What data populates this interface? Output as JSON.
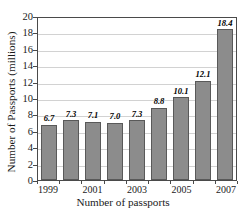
{
  "chart_data": {
    "type": "bar",
    "title": "",
    "xlabel": "Number of passports",
    "ylabel": "Number of Passports (millions)",
    "categories": [
      "1999",
      "2000",
      "2001",
      "2002",
      "2003",
      "2004",
      "2005",
      "2006",
      "2007"
    ],
    "values": [
      6.7,
      7.3,
      7.1,
      7.0,
      7.3,
      8.8,
      10.1,
      12.1,
      18.4
    ],
    "value_labels": [
      "6.7",
      "7.3",
      "7.1",
      "7.0",
      "7.3",
      "8.8",
      "10.1",
      "12.1",
      "18.4"
    ],
    "visible_category_labels": [
      "1999",
      "2001",
      "2003",
      "2005",
      "2007"
    ],
    "ylim": [
      0,
      20
    ],
    "ytick_values": [
      0,
      2,
      4,
      6,
      8,
      10,
      12,
      14,
      16,
      18,
      20
    ],
    "ytick_labels": [
      "0",
      "2",
      "4",
      "6",
      "8",
      "10",
      "12",
      "14",
      "16",
      "18",
      "20"
    ],
    "grid": true,
    "legend": "none",
    "bar_color": "#8c8c8c",
    "bar_edge_color": "#595959",
    "grid_color": "#d2d2d2",
    "axis_color": "#4a4a4a",
    "text_color": "#1a1a1a"
  }
}
